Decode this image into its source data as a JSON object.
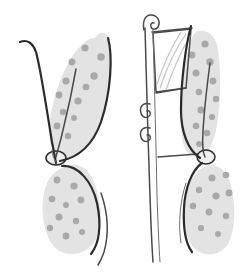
{
  "image": {
    "kind": "line-art-illustration",
    "subject": "paired-lobed-specimen-diagram",
    "width": 242,
    "height": 274,
    "background_color": "#ffffff",
    "caption_text": "",
    "labels": []
  },
  "palette": {
    "background": "#ffffff",
    "lobe_fill": "#e3e3e3",
    "lobe_fill_alt": "#e6e6e6",
    "speck": "#a9a9a9",
    "speck_dark": "#9e9e9e",
    "contour_heavy": "#2b2b2b",
    "contour_medium": "#4a4a4a",
    "contour_light": "#6e6e6e",
    "frame_stroke": "#3a3a3a",
    "ghost_stroke": "#c4c4c4",
    "node_fill": "#efefef"
  },
  "strokes": {
    "heavy_width": 2.2,
    "medium_width": 1.5,
    "light_width": 1.0,
    "hairline_width": 0.8,
    "ghost_width": 1.2
  },
  "figures": [
    {
      "id": "left-figure",
      "name": "Left specimen",
      "has_frame": false,
      "upper_lobe": {
        "name": "upper-wing-lobe",
        "shape": "teardrop",
        "orientation": "apex-down",
        "fill": "#e3e3e3",
        "path": "M 95 38 C 100 30 108 31 110 42 C 113 60 110 96 100 124 C 93 143 82 154 72 158 C 62 160 52 152 50 142 C 47 120 56 84 70 60 C 79 45 88 38 95 38 Z",
        "speck_count": 12,
        "specks": [
          {
            "cx": 85,
            "cy": 48,
            "r": 3.6
          },
          {
            "cx": 101,
            "cy": 57,
            "r": 3.8
          },
          {
            "cx": 72,
            "cy": 62,
            "r": 3.4
          },
          {
            "cx": 94,
            "cy": 76,
            "r": 3.7
          },
          {
            "cx": 66,
            "cy": 81,
            "r": 3.5
          },
          {
            "cx": 86,
            "cy": 87,
            "r": 3.3
          },
          {
            "cx": 59,
            "cy": 95,
            "r": 3.4
          },
          {
            "cx": 78,
            "cy": 101,
            "r": 3.6
          },
          {
            "cx": 63,
            "cy": 112,
            "r": 3.2
          },
          {
            "cx": 74,
            "cy": 118,
            "r": 3.0
          },
          {
            "cx": 57,
            "cy": 126,
            "r": 3.4
          },
          {
            "cx": 68,
            "cy": 136,
            "r": 3.2
          }
        ]
      },
      "lower_lobe": {
        "name": "lower-round-lobe",
        "shape": "oblong-oval",
        "orientation": "apex-up",
        "fill": "#e3e3e3",
        "path": "M 62 168 C 74 160 88 166 94 182 C 102 203 103 224 96 239 C 88 254 70 258 58 250 C 46 241 41 220 43 199 C 45 182 52 172 62 168 Z",
        "speck_count": 10,
        "specks": [
          {
            "cx": 57,
            "cy": 180,
            "r": 3.4
          },
          {
            "cx": 74,
            "cy": 186,
            "r": 3.6
          },
          {
            "cx": 52,
            "cy": 199,
            "r": 3.3
          },
          {
            "cx": 66,
            "cy": 205,
            "r": 3.0
          },
          {
            "cx": 81,
            "cy": 200,
            "r": 3.4
          },
          {
            "cx": 59,
            "cy": 217,
            "r": 3.5
          },
          {
            "cx": 76,
            "cy": 221,
            "r": 3.2
          },
          {
            "cx": 50,
            "cy": 228,
            "r": 3.2
          },
          {
            "cx": 66,
            "cy": 236,
            "r": 3.4
          },
          {
            "cx": 82,
            "cy": 232,
            "r": 3.0
          }
        ]
      },
      "node": {
        "name": "waist-node",
        "cx": 56,
        "cy": 158,
        "rx": 10,
        "ry": 7,
        "fill": "#efefef"
      },
      "contours": [
        {
          "name": "outer-left-stem",
          "path": "M 20 42 C 27 39 33 43 36 52 C 41 70 47 112 52 142 C 54 152 55 158 56 163",
          "weight": "heavy"
        },
        {
          "name": "outer-right-edge",
          "path": "M 108 38 C 113 56 111 92 101 122 C 92 147 76 158 60 161",
          "weight": "heavy"
        },
        {
          "name": "inner-vein",
          "path": "M 76 69 C 73 86 68 110 63 130 C 60 144 57 152 56 157",
          "weight": "medium"
        },
        {
          "name": "lower-right-contour",
          "path": "M 62 166 C 78 165 92 181 97 203 C 102 226 99 244 91 254",
          "weight": "heavy"
        },
        {
          "name": "lower-outer-tail",
          "path": "M 101 193 C 108 213 109 234 104 252 C 102 258 100 262 98 265",
          "weight": "medium"
        },
        {
          "name": "stem-tail",
          "path": "M 52 150 C 52 155 54 159 56 162",
          "weight": "light"
        }
      ],
      "tendrils": []
    },
    {
      "id": "right-figure",
      "name": "Right specimen with frame",
      "has_frame": true,
      "upper_lobe": {
        "name": "upper-wing-lobe",
        "shape": "teardrop",
        "orientation": "apex-down",
        "fill": "#e3e3e3",
        "path": "M 196 32 C 204 28 214 33 217 45 C 221 64 221 96 218 118 C 216 136 211 148 205 154 C 197 160 188 156 184 146 C 178 126 180 88 186 60 C 189 44 192 35 196 32 Z",
        "speck_count": 12,
        "specks": [
          {
            "cx": 205,
            "cy": 44,
            "r": 3.6
          },
          {
            "cx": 192,
            "cy": 55,
            "r": 3.4
          },
          {
            "cx": 210,
            "cy": 62,
            "r": 3.7
          },
          {
            "cx": 196,
            "cy": 73,
            "r": 3.5
          },
          {
            "cx": 213,
            "cy": 81,
            "r": 3.4
          },
          {
            "cx": 199,
            "cy": 92,
            "r": 3.3
          },
          {
            "cx": 216,
            "cy": 99,
            "r": 3.2
          },
          {
            "cx": 201,
            "cy": 110,
            "r": 3.5
          },
          {
            "cx": 212,
            "cy": 117,
            "r": 3.1
          },
          {
            "cx": 196,
            "cy": 126,
            "r": 3.3
          },
          {
            "cx": 207,
            "cy": 133,
            "r": 3.2
          },
          {
            "cx": 199,
            "cy": 144,
            "r": 3.0
          }
        ]
      },
      "lower_lobe": {
        "name": "lower-round-lobe",
        "shape": "oblong-oval",
        "orientation": "apex-up",
        "fill": "#e3e3e3",
        "path": "M 206 166 C 218 162 229 172 232 190 C 236 211 235 231 228 244 C 220 256 204 258 194 248 C 184 237 181 214 186 194 C 190 178 198 169 206 166 Z",
        "speck_count": 10,
        "specks": [
          {
            "cx": 212,
            "cy": 178,
            "r": 3.5
          },
          {
            "cx": 226,
            "cy": 175,
            "r": 3.3
          },
          {
            "cx": 199,
            "cy": 190,
            "r": 3.2
          },
          {
            "cx": 216,
            "cy": 196,
            "r": 3.6
          },
          {
            "cx": 229,
            "cy": 193,
            "r": 3.4
          },
          {
            "cx": 193,
            "cy": 206,
            "r": 3.3
          },
          {
            "cx": 209,
            "cy": 212,
            "r": 3.4
          },
          {
            "cx": 226,
            "cy": 216,
            "r": 3.2
          },
          {
            "cx": 201,
            "cy": 228,
            "r": 3.1
          },
          {
            "cx": 218,
            "cy": 234,
            "r": 3.0
          }
        ]
      },
      "node": {
        "name": "waist-node",
        "cx": 206,
        "cy": 157,
        "rx": 9,
        "ry": 7,
        "fill": "#efefef"
      },
      "contours": [
        {
          "name": "outer-left-edge",
          "path": "M 191 26 C 186 44 181 80 181 110 C 181 132 188 150 200 158",
          "weight": "heavy"
        },
        {
          "name": "inner-vein",
          "path": "M 210 63 C 207 86 204 112 203 132 C 202 146 203 153 205 157",
          "weight": "medium"
        },
        {
          "name": "lower-left-contour",
          "path": "M 202 163 C 192 170 185 188 184 208 C 183 228 186 244 192 252",
          "weight": "heavy"
        },
        {
          "name": "lower-outer-tail",
          "path": "M 186 183 C 180 201 178 224 181 243",
          "weight": "light"
        }
      ],
      "frame": {
        "name": "ladder-frame",
        "rails": [
          {
            "name": "rail-outer-left",
            "path": "M 145 28 C 146 70 148 140 150 196 C 151 226 152 248 153 262",
            "weight": "medium"
          },
          {
            "name": "rail-inner-left",
            "path": "M 153 30 C 154 72 156 140 157 196 C 158 226 159 248 160 262",
            "weight": "light"
          }
        ],
        "top_hook": {
          "name": "top-hook-curl",
          "path": "M 144 30 C 142 20 146 14 152 15 C 158 16 161 22 158 27 C 156 30 152 30 151 27 C 150 24 152 22 154 23",
          "weight": "medium"
        },
        "rungs": [
          {
            "name": "rung-top",
            "path": "M 152 32 L 192 28",
            "weight": "medium"
          },
          {
            "name": "rung-middle",
            "path": "M 156 93 L 186 88",
            "weight": "medium"
          },
          {
            "name": "rung-lower",
            "path": "M 158 157 L 198 154",
            "weight": "medium"
          }
        ],
        "panel": {
          "name": "upper-panel",
          "path": "M 153 33 L 191 29 L 186 88 L 156 92 Z",
          "inner_curves": [
            {
              "name": "panel-curve-a",
              "path": "M 160 88 C 166 70 176 48 186 34",
              "weight": "ghost"
            },
            {
              "name": "panel-curve-b",
              "path": "M 166 90 C 172 72 182 50 190 36",
              "weight": "ghost"
            },
            {
              "name": "panel-curve-c",
              "path": "M 157 84 C 163 66 172 46 181 32",
              "weight": "ghost"
            }
          ]
        },
        "spirals": [
          {
            "name": "spiral-upper",
            "cx": 146,
            "cy": 110,
            "path": "M 150 104 C 143 102 139 107 141 113 C 142 118 148 119 150 115 C 151 112 149 110 147 111",
            "weight": "medium"
          },
          {
            "name": "spiral-lower",
            "cx": 146,
            "cy": 134,
            "path": "M 150 128 C 143 126 139 131 141 137 C 142 142 148 143 150 139 C 151 136 149 134 147 135",
            "weight": "medium"
          }
        ]
      },
      "tendrils": []
    }
  ],
  "legend": {
    "present": false,
    "entries": []
  }
}
